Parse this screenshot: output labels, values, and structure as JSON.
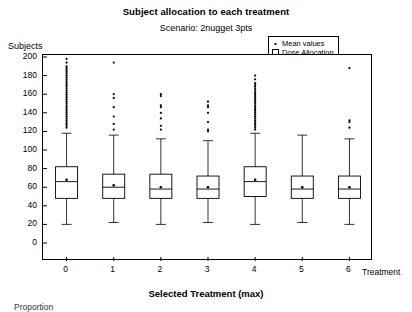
{
  "chart_data": {
    "type": "box",
    "title": "Subject allocation to each treatment",
    "subtitle": "Scenario: 2nugget 3pts",
    "xlabel": "Selected Treatment (max)",
    "ylabel": "Subjects",
    "xaxis_name": "Treatment",
    "footnote": "Proportion",
    "grid": false,
    "ylim": [
      0,
      200
    ],
    "yticks": [
      0,
      20,
      40,
      60,
      80,
      100,
      120,
      140,
      160,
      180,
      200
    ],
    "categories": [
      "0",
      "1",
      "2",
      "3",
      "4",
      "5",
      "6"
    ],
    "legend": {
      "position": "top-right",
      "entries": [
        {
          "label": "Mean values",
          "symbol": "dot"
        },
        {
          "label": "Dose Allocation",
          "symbol": "open-square"
        }
      ]
    },
    "boxes": [
      {
        "category": "0",
        "lower_whisker": 20,
        "q1": 48,
        "median": 66,
        "mean": 68,
        "q3": 82,
        "upper_whisker": 118,
        "outliers": [
          124,
          126,
          128,
          130,
          132,
          134,
          136,
          138,
          140,
          142,
          144,
          146,
          148,
          150,
          152,
          154,
          156,
          158,
          160,
          162,
          164,
          166,
          168,
          170,
          172,
          174,
          176,
          178,
          180,
          182,
          184,
          186,
          188,
          190,
          194,
          198
        ]
      },
      {
        "category": "1",
        "lower_whisker": 22,
        "q1": 48,
        "median": 60,
        "mean": 62,
        "q3": 74,
        "upper_whisker": 116,
        "outliers": [
          122,
          128,
          136,
          146,
          156,
          160,
          194
        ]
      },
      {
        "category": "2",
        "lower_whisker": 20,
        "q1": 48,
        "median": 58,
        "mean": 60,
        "q3": 74,
        "upper_whisker": 112,
        "outliers": [
          122,
          126,
          134,
          140,
          146,
          148,
          158,
          160
        ]
      },
      {
        "category": "3",
        "lower_whisker": 22,
        "q1": 48,
        "median": 58,
        "mean": 60,
        "q3": 72,
        "upper_whisker": 110,
        "outliers": [
          120,
          122,
          130,
          140,
          146,
          148,
          152
        ]
      },
      {
        "category": "4",
        "lower_whisker": 20,
        "q1": 50,
        "median": 66,
        "mean": 68,
        "q3": 82,
        "upper_whisker": 118,
        "outliers": [
          122,
          124,
          126,
          128,
          130,
          132,
          134,
          136,
          138,
          140,
          142,
          144,
          146,
          148,
          150,
          152,
          154,
          156,
          158,
          160,
          162,
          164,
          166,
          168,
          170,
          172,
          176,
          180
        ]
      },
      {
        "category": "5",
        "lower_whisker": 22,
        "q1": 48,
        "median": 58,
        "mean": 60,
        "q3": 72,
        "upper_whisker": 116,
        "outliers": []
      },
      {
        "category": "6",
        "lower_whisker": 20,
        "q1": 48,
        "median": 58,
        "mean": 60,
        "q3": 72,
        "upper_whisker": 112,
        "outliers": [
          124,
          130,
          132,
          188
        ]
      }
    ]
  },
  "colors": {
    "axis": "#000000",
    "box": "#000000",
    "background": "#ffffff"
  }
}
